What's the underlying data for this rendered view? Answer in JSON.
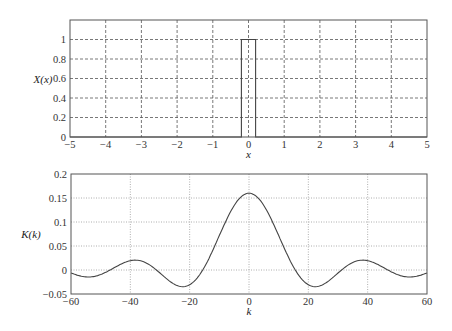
{
  "chart_data": [
    {
      "type": "line",
      "title": "",
      "xlabel": "x",
      "ylabel": "X(x)",
      "xlim": [
        -5,
        5
      ],
      "ylim": [
        0,
        1.2
      ],
      "xticks": [
        -5,
        -4,
        -3,
        -2,
        -1,
        0,
        1,
        2,
        3,
        4,
        5
      ],
      "yticks": [
        0,
        0.2,
        0.4,
        0.6,
        0.8,
        1
      ],
      "ytick_labels": [
        "0",
        "0.2",
        "0.4",
        "0.6",
        "0.8",
        "1"
      ],
      "xtick_labels": [
        "−5",
        "−4",
        "−3",
        "−2",
        "−1",
        "0",
        "1",
        "2",
        "3",
        "4",
        "5"
      ],
      "grid": "dashed",
      "series": [
        {
          "name": "X(x)",
          "description": "rectangular pulse",
          "x": [
            -5,
            -0.2,
            -0.2,
            0.2,
            0.2,
            5
          ],
          "y": [
            0,
            0,
            1,
            1,
            0,
            0
          ]
        }
      ]
    },
    {
      "type": "line",
      "title": "",
      "xlabel": "k",
      "ylabel": "K(k)",
      "xlim": [
        -60,
        60
      ],
      "ylim": [
        -0.05,
        0.2
      ],
      "xticks": [
        -60,
        -40,
        -20,
        0,
        20,
        40,
        60
      ],
      "xtick_labels": [
        "−60",
        "−40",
        "−20",
        "0",
        "20",
        "40",
        "60"
      ],
      "yticks": [
        -0.05,
        0,
        0.05,
        0.1,
        0.15,
        0.2
      ],
      "ytick_labels": [
        "−0.05",
        "0",
        "0.05",
        "0.1",
        "0.15",
        "0.2"
      ],
      "grid": "dotted",
      "series": [
        {
          "name": "K(k)",
          "description": "sinc-shaped transform of the pulse",
          "x": [
            -60,
            -56,
            -52,
            -48,
            -44,
            -40,
            -36,
            -32,
            -28,
            -24,
            -20,
            -16,
            -12,
            -8,
            -4,
            0,
            4,
            8,
            12,
            16,
            20,
            24,
            28,
            32,
            36,
            40,
            44,
            48,
            52,
            56,
            60
          ],
          "y": [
            -0.0095,
            -0.0128,
            -0.01,
            -0.001,
            0.0107,
            0.0198,
            0.0211,
            0.0114,
            -0.0066,
            -0.0261,
            -0.0363,
            -0.0262,
            0.0134,
            0.0754,
            0.1333,
            0.16,
            0.1333,
            0.0754,
            0.0134,
            -0.0262,
            -0.0363,
            -0.0261,
            -0.0066,
            0.0114,
            0.0211,
            0.0198,
            0.0107,
            -0.001,
            -0.01,
            -0.0128,
            -0.0095
          ]
        }
      ]
    }
  ]
}
